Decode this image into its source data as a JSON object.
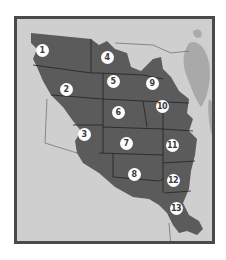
{
  "map": {
    "title": "",
    "colors": {
      "land": "#cfcfcf",
      "region": "#5b5b5b",
      "water": "#a9a9a9",
      "frame": "#4a4a4a",
      "marker_bg": "#ffffff",
      "marker_text": "#3a3a3a"
    },
    "regions": [
      {
        "id": "1",
        "label": "1",
        "x": 42,
        "y": 50
      },
      {
        "id": "2",
        "label": "2",
        "x": 66,
        "y": 89
      },
      {
        "id": "3",
        "label": "3",
        "x": 84,
        "y": 134
      },
      {
        "id": "4",
        "label": "4",
        "x": 107,
        "y": 57
      },
      {
        "id": "5",
        "label": "5",
        "x": 113,
        "y": 81
      },
      {
        "id": "6",
        "label": "6",
        "x": 118,
        "y": 112
      },
      {
        "id": "7",
        "label": "7",
        "x": 126,
        "y": 143
      },
      {
        "id": "8",
        "label": "8",
        "x": 134,
        "y": 174
      },
      {
        "id": "9",
        "label": "9",
        "x": 152,
        "y": 83
      },
      {
        "id": "10",
        "label": "10",
        "x": 162,
        "y": 106
      },
      {
        "id": "11",
        "label": "11",
        "x": 172,
        "y": 145
      },
      {
        "id": "12",
        "label": "12",
        "x": 173,
        "y": 180
      },
      {
        "id": "13",
        "label": "13",
        "x": 176,
        "y": 208
      }
    ]
  }
}
